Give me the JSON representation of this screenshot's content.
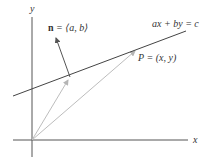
{
  "diagram": {
    "axes": {
      "x_label": "x",
      "y_label": "y"
    },
    "line": {
      "equation": "ax + by = c"
    },
    "normal_vector": {
      "label": "n = ⟨a, b⟩",
      "symbol": "n",
      "rest": " = ⟨a, b⟩"
    },
    "point": {
      "label": "P = (x, y)"
    },
    "colors": {
      "axis": "#555555",
      "line": "#444444",
      "normal": "#555555",
      "position_vectors": "#bbbbbb"
    }
  }
}
